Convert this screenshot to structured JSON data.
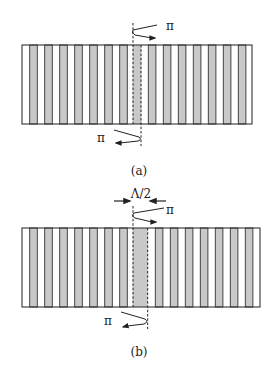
{
  "colors": {
    "stripe_gray": "#c8c8c8",
    "outline": "#333333",
    "background": "#ffffff"
  },
  "panels": [
    {
      "id": "a",
      "caption": "(a)",
      "rect": {
        "x": 22,
        "y": 45,
        "w": 230,
        "h": 79
      },
      "period": 15,
      "stripe_width": 7.6,
      "first_stripe_x": 29.7,
      "stripes_left": 7,
      "defect": {
        "x": 132.7,
        "w": 8.6
      },
      "stripes_right_start": 148.3,
      "stripes_right": 7,
      "dashed_top_x": 133,
      "dashed_bottom_x": 141,
      "top_arrow": {
        "label": "π",
        "path": "M157,25 L133,30 Q131,33 135,35 L152,38",
        "head": [
          155,
          38
        ],
        "label_pos": [
          166,
          30
        ]
      },
      "bottom_arrow": {
        "label": "π",
        "path": "M114,130 L139,137 Q142,140 138,141 L120,143",
        "head": [
          116,
          143
        ],
        "label_pos": [
          97,
          142
        ]
      },
      "half_period_marker": null,
      "caption_pos": [
        139,
        175
      ]
    },
    {
      "id": "b",
      "caption": "(b)",
      "rect": {
        "x": 22,
        "y": 228,
        "w": 238,
        "h": 79
      },
      "period": 15,
      "stripe_width": 7.6,
      "first_stripe_x": 29.7,
      "stripes_left": 7,
      "defect": {
        "x": 132.7,
        "w": 15
      },
      "stripes_right_start": 155.3,
      "stripes_right": 7,
      "dashed_top_x": 133,
      "dashed_bottom_x": 147.7,
      "top_arrow": {
        "label": "π",
        "path": "M164,208 L134,213 Q131,216 135,218 L152,222",
        "head": [
          156,
          222
        ],
        "label_pos": [
          166,
          214
        ]
      },
      "bottom_arrow": {
        "label": "π",
        "path": "M121,312 L145,319 Q149,322 144,324 L127,326",
        "head": [
          123,
          327
        ],
        "label_pos": [
          104,
          325
        ]
      },
      "half_period_marker": {
        "label": "Λ/2",
        "y": 201,
        "left_arrow": [
          114,
          130
        ],
        "right_arrow": [
          166,
          150
        ],
        "label_pos": [
          141,
          198
        ]
      },
      "caption_pos": [
        139,
        356
      ]
    }
  ]
}
